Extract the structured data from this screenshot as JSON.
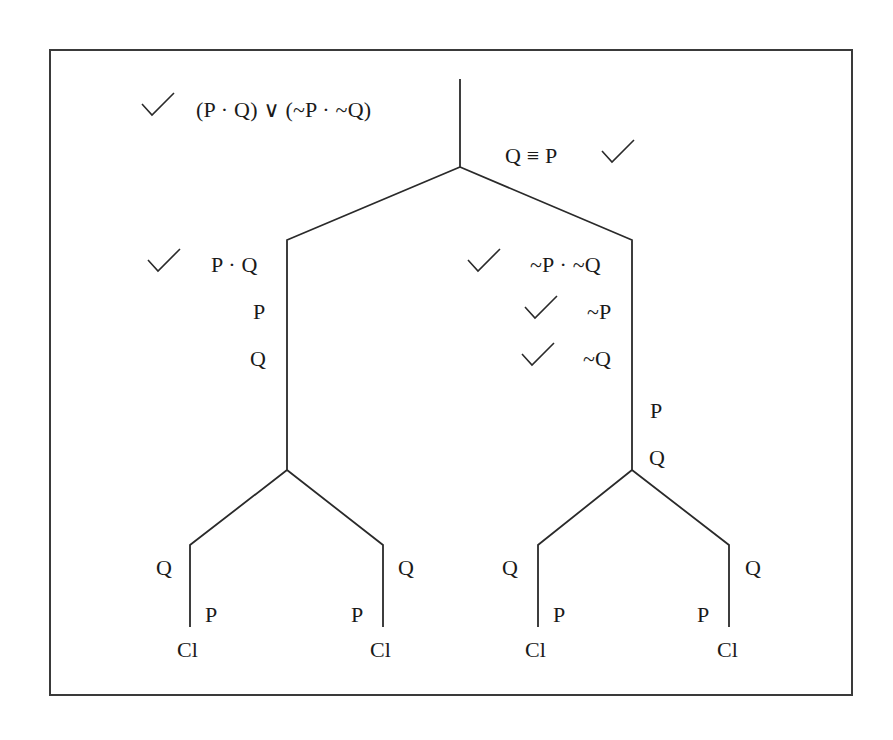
{
  "diagram": {
    "type": "truth-tree",
    "premises": [
      {
        "id": "premise-1",
        "text": "(P · Q) ∨ (~P · ~Q)",
        "checked": true
      },
      {
        "id": "premise-2",
        "text": "Q ≡ P",
        "checked": true
      }
    ],
    "left_branch": {
      "nodes": [
        {
          "text": "P · Q",
          "checked": true
        },
        {
          "text": "P",
          "checked": false
        },
        {
          "text": "Q",
          "checked": false
        }
      ],
      "children": [
        {
          "nodes": [
            {
              "text": "Q"
            },
            {
              "text": "P"
            }
          ],
          "terminal": "Cl"
        },
        {
          "nodes": [
            {
              "text": "Q"
            },
            {
              "text": "P"
            }
          ],
          "terminal": "Cl"
        }
      ]
    },
    "right_branch": {
      "nodes": [
        {
          "text": "~P · ~Q",
          "checked": true
        },
        {
          "text": "~P",
          "checked": true
        },
        {
          "text": "~Q",
          "checked": true
        },
        {
          "text": "P",
          "checked": false
        },
        {
          "text": "Q",
          "checked": false
        }
      ],
      "children": [
        {
          "nodes": [
            {
              "text": "Q"
            },
            {
              "text": "P"
            }
          ],
          "terminal": "Cl"
        },
        {
          "nodes": [
            {
              "text": "Q"
            },
            {
              "text": "P"
            }
          ],
          "terminal": "Cl"
        }
      ]
    },
    "check_icon": "checkmark-icon",
    "colors": {
      "line": "#2a2a2a",
      "text": "#1a1a1a",
      "frame": "#3a3a3a",
      "background": "#ffffff"
    }
  }
}
